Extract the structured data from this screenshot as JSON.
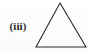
{
  "figure": {
    "background_color": "#fdfdfd",
    "width": 89,
    "height": 53,
    "label": {
      "text": "(iii)",
      "numeral": "iii",
      "color": "#2b2b2b"
    },
    "shape": {
      "name": "triangle",
      "kind": "outline",
      "orientation": "apex-up",
      "stroke_color": "#2a2a2a",
      "fill": "none",
      "stroke_width": 1.1,
      "points": "60,3 86,47 36,47",
      "vertices": [
        {
          "label": "apex",
          "x": 60,
          "y": 3
        },
        {
          "label": "base-right",
          "x": 86,
          "y": 47
        },
        {
          "label": "base-left",
          "x": 36,
          "y": 47
        }
      ]
    }
  }
}
